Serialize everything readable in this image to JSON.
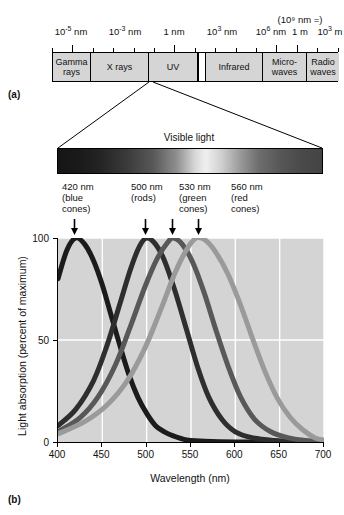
{
  "figure": {
    "panel_a_label": "(a)",
    "panel_b_label": "(b)"
  },
  "panel_a": {
    "scale_labels": [
      {
        "text": "10",
        "sup": "-5",
        "unit": " nm",
        "x": 71
      },
      {
        "text": "10",
        "sup": "-3",
        "unit": " nm",
        "x": 125
      },
      {
        "text": "1",
        "sup": "",
        "unit": " nm",
        "x": 174
      },
      {
        "text": "10",
        "sup": "3",
        "unit": " nm",
        "x": 222
      },
      {
        "text": "10",
        "sup": "6",
        "unit": " nm",
        "x": 271
      },
      {
        "text": "1",
        "sup": "",
        "unit": " m",
        "x": 300
      },
      {
        "text": "10",
        "sup": "3",
        "unit": " m",
        "x": 330
      }
    ],
    "meter_note": "(10⁹ nm =)",
    "bands": [
      {
        "name": "gamma-rays",
        "label": "Gamma rays",
        "left": 0,
        "width": 38
      },
      {
        "name": "x-rays",
        "label": "X rays",
        "left": 38,
        "width": 58
      },
      {
        "name": "uv",
        "label": "UV",
        "left": 96,
        "width": 49
      },
      {
        "name": "visible-gap",
        "label": "",
        "left": 145,
        "width": 8
      },
      {
        "name": "infrared",
        "label": "Infrared",
        "left": 153,
        "width": 57
      },
      {
        "name": "microwaves",
        "label": "Micro- waves",
        "left": 210,
        "width": 44
      },
      {
        "name": "radio-waves",
        "label": "Radio waves",
        "left": 254,
        "width": 32
      }
    ]
  },
  "panel_b": {
    "visible_light_caption": "Visible light",
    "callouts": [
      {
        "name": "blue-cones",
        "line1": "420 nm",
        "line2": "(blue",
        "line3": "cones)",
        "x": 62,
        "arrow_x": 76,
        "peak_nm": 420
      },
      {
        "name": "rods",
        "line1": "500 nm",
        "line2": "(rods)",
        "line3": "",
        "x": 131,
        "arrow_x": 147,
        "peak_nm": 500
      },
      {
        "name": "green-cones",
        "line1": "530 nm",
        "line2": "(green",
        "line3": "cones)",
        "x": 179,
        "arrow_x": 174,
        "peak_nm": 530
      },
      {
        "name": "red-cones",
        "line1": "560 nm",
        "line2": "(red",
        "line3": "cones)",
        "x": 231,
        "arrow_x": 200,
        "peak_nm": 560
      }
    ]
  },
  "chart_data": {
    "type": "line",
    "xlabel": "Wavelength (nm)",
    "ylabel": "Light absorption (percent of maximum)",
    "xlim": [
      400,
      700
    ],
    "ylim": [
      0,
      100
    ],
    "xticks": [
      400,
      450,
      500,
      550,
      600,
      650,
      700
    ],
    "yticks": [
      0,
      50,
      100
    ],
    "grid": true,
    "grid_color": "#ffffff",
    "plot_background": "#d4d4d4",
    "legend_position": "none",
    "series": [
      {
        "name": "420 nm (blue cones)",
        "peak_nm": 420,
        "color": "#1b1b1b",
        "points": [
          {
            "x": 400,
            "y": 80
          },
          {
            "x": 410,
            "y": 94
          },
          {
            "x": 420,
            "y": 100
          },
          {
            "x": 430,
            "y": 97
          },
          {
            "x": 440,
            "y": 89
          },
          {
            "x": 450,
            "y": 77
          },
          {
            "x": 460,
            "y": 62
          },
          {
            "x": 470,
            "y": 47
          },
          {
            "x": 480,
            "y": 33
          },
          {
            "x": 490,
            "y": 22
          },
          {
            "x": 500,
            "y": 14
          },
          {
            "x": 510,
            "y": 8
          },
          {
            "x": 520,
            "y": 5
          },
          {
            "x": 530,
            "y": 3
          },
          {
            "x": 545,
            "y": 1
          },
          {
            "x": 560,
            "y": 0.5
          },
          {
            "x": 600,
            "y": 0
          },
          {
            "x": 700,
            "y": 0
          }
        ]
      },
      {
        "name": "500 nm (rods)",
        "peak_nm": 500,
        "color": "#2e2e2e",
        "points": [
          {
            "x": 400,
            "y": 8
          },
          {
            "x": 420,
            "y": 16
          },
          {
            "x": 440,
            "y": 30
          },
          {
            "x": 455,
            "y": 47
          },
          {
            "x": 470,
            "y": 68
          },
          {
            "x": 482,
            "y": 85
          },
          {
            "x": 492,
            "y": 96
          },
          {
            "x": 500,
            "y": 100
          },
          {
            "x": 510,
            "y": 97
          },
          {
            "x": 520,
            "y": 89
          },
          {
            "x": 532,
            "y": 74
          },
          {
            "x": 545,
            "y": 55
          },
          {
            "x": 558,
            "y": 36
          },
          {
            "x": 570,
            "y": 22
          },
          {
            "x": 585,
            "y": 11
          },
          {
            "x": 600,
            "y": 5
          },
          {
            "x": 620,
            "y": 2
          },
          {
            "x": 645,
            "y": 0.7
          },
          {
            "x": 670,
            "y": 0.2
          },
          {
            "x": 700,
            "y": 0
          }
        ]
      },
      {
        "name": "530 nm (green cones)",
        "peak_nm": 530,
        "color": "#585858",
        "points": [
          {
            "x": 400,
            "y": 5
          },
          {
            "x": 425,
            "y": 12
          },
          {
            "x": 445,
            "y": 22
          },
          {
            "x": 465,
            "y": 38
          },
          {
            "x": 482,
            "y": 57
          },
          {
            "x": 498,
            "y": 76
          },
          {
            "x": 512,
            "y": 90
          },
          {
            "x": 524,
            "y": 98
          },
          {
            "x": 530,
            "y": 100
          },
          {
            "x": 540,
            "y": 97
          },
          {
            "x": 552,
            "y": 88
          },
          {
            "x": 565,
            "y": 73
          },
          {
            "x": 578,
            "y": 55
          },
          {
            "x": 592,
            "y": 37
          },
          {
            "x": 606,
            "y": 22
          },
          {
            "x": 622,
            "y": 11
          },
          {
            "x": 640,
            "y": 5
          },
          {
            "x": 660,
            "y": 2
          },
          {
            "x": 680,
            "y": 0.7
          },
          {
            "x": 700,
            "y": 0
          }
        ]
      },
      {
        "name": "560 nm (red cones)",
        "peak_nm": 560,
        "color": "#9a9a9a",
        "points": [
          {
            "x": 400,
            "y": 4
          },
          {
            "x": 430,
            "y": 10
          },
          {
            "x": 455,
            "y": 18
          },
          {
            "x": 478,
            "y": 30
          },
          {
            "x": 498,
            "y": 46
          },
          {
            "x": 516,
            "y": 65
          },
          {
            "x": 532,
            "y": 83
          },
          {
            "x": 546,
            "y": 95
          },
          {
            "x": 556,
            "y": 100
          },
          {
            "x": 566,
            "y": 99
          },
          {
            "x": 578,
            "y": 93
          },
          {
            "x": 592,
            "y": 82
          },
          {
            "x": 606,
            "y": 67
          },
          {
            "x": 620,
            "y": 50
          },
          {
            "x": 634,
            "y": 34
          },
          {
            "x": 648,
            "y": 21
          },
          {
            "x": 662,
            "y": 12
          },
          {
            "x": 676,
            "y": 6
          },
          {
            "x": 690,
            "y": 2
          },
          {
            "x": 700,
            "y": 1
          }
        ]
      }
    ]
  }
}
